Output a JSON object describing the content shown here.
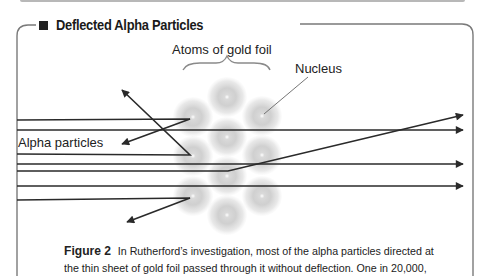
{
  "section": {
    "title": "Deflected Alpha Particles",
    "title_marker_icon": "black-square"
  },
  "diagram": {
    "labels": {
      "atoms": "Atoms of gold foil",
      "nucleus": "Nucleus",
      "alpha": "Alpha particles"
    },
    "atoms": [
      {
        "cx": 227,
        "cy": 97
      },
      {
        "cx": 193,
        "cy": 117
      },
      {
        "cx": 262,
        "cy": 116
      },
      {
        "cx": 227,
        "cy": 137
      },
      {
        "cx": 193,
        "cy": 156
      },
      {
        "cx": 262,
        "cy": 155
      },
      {
        "cx": 227,
        "cy": 176
      },
      {
        "cx": 193,
        "cy": 196
      },
      {
        "cx": 262,
        "cy": 196
      },
      {
        "cx": 227,
        "cy": 215
      }
    ],
    "paths_description": [
      "straight through (y=130)",
      "straight through (y=165)",
      "straight through (y=186)",
      "slightly deflected upward",
      "reflected back up-left",
      "reflected back down-left (top)",
      "reflected back down-left (bottom)"
    ],
    "colors": {
      "line": "#2a2a2a",
      "atom": "#9a9a9a",
      "frame": "#777777"
    }
  },
  "caption": {
    "figure_label": "Figure 2",
    "line1": "In Rutherford’s investigation, most of the alpha particles directed at",
    "line2": "the thin sheet of gold foil passed through it without deflection. One in 20,000,"
  }
}
